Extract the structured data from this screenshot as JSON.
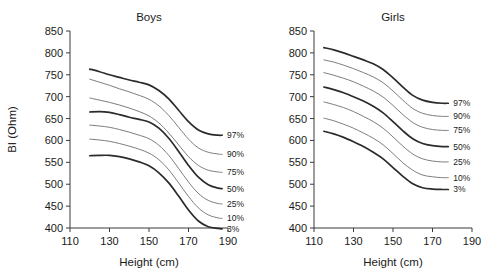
{
  "figure": {
    "width": 498,
    "height": 275,
    "background": "#ffffff",
    "ink_color": "#1a1a1a",
    "axis_color": "#3a3a3a"
  },
  "chart_data": [
    {
      "type": "line",
      "title": "Boys",
      "xlabel": "Height (cm)",
      "ylabel": "BI (Ohm)",
      "xlim": [
        110,
        190
      ],
      "ylim": [
        400,
        850
      ],
      "xticks": [
        110,
        130,
        150,
        170,
        190
      ],
      "yticks": [
        400,
        450,
        500,
        550,
        600,
        650,
        700,
        750,
        800,
        850
      ],
      "grid": false,
      "legend_position": "right-of-curve-ends",
      "x": [
        120,
        125,
        130,
        135,
        140,
        145,
        150,
        155,
        160,
        165,
        170,
        175,
        180,
        185,
        187
      ],
      "series": [
        {
          "name": "97%",
          "label": "97%",
          "emphasis": true,
          "color": "#2b2b2b",
          "width": 1.7,
          "values": [
            763,
            757,
            750,
            744,
            738,
            733,
            727,
            714,
            695,
            669,
            643,
            624,
            615,
            612,
            612
          ]
        },
        {
          "name": "90%",
          "label": "90%",
          "emphasis": false,
          "color": "#6e6e6e",
          "width": 0.9,
          "values": [
            740,
            733,
            726,
            718,
            711,
            703,
            694,
            679,
            657,
            630,
            603,
            583,
            573,
            569,
            568
          ]
        },
        {
          "name": "75%",
          "label": "75%",
          "emphasis": false,
          "color": "#6e6e6e",
          "width": 0.9,
          "values": [
            697,
            692,
            687,
            681,
            674,
            666,
            656,
            640,
            617,
            590,
            563,
            543,
            532,
            528,
            527
          ]
        },
        {
          "name": "50%",
          "label": "50%",
          "emphasis": true,
          "color": "#2b2b2b",
          "width": 1.7,
          "values": [
            665,
            666,
            664,
            659,
            653,
            648,
            642,
            628,
            605,
            575,
            543,
            516,
            499,
            491,
            490
          ]
        },
        {
          "name": "25%",
          "label": "25%",
          "emphasis": false,
          "color": "#6e6e6e",
          "width": 0.9,
          "values": [
            635,
            633,
            630,
            625,
            619,
            612,
            604,
            589,
            566,
            536,
            505,
            479,
            463,
            456,
            455
          ]
        },
        {
          "name": "10%",
          "label": "10%",
          "emphasis": false,
          "color": "#6e6e6e",
          "width": 0.9,
          "values": [
            603,
            601,
            598,
            593,
            587,
            580,
            571,
            556,
            533,
            503,
            472,
            446,
            430,
            423,
            422
          ]
        },
        {
          "name": "3%",
          "label": "3%",
          "emphasis": true,
          "color": "#2b2b2b",
          "width": 1.7,
          "values": [
            565,
            566,
            566,
            563,
            558,
            551,
            542,
            526,
            503,
            473,
            441,
            416,
            403,
            399,
            398
          ]
        }
      ]
    },
    {
      "type": "line",
      "title": "Girls",
      "xlabel": "Height (cm)",
      "ylabel": "BI (Ohm)",
      "xlim": [
        110,
        190
      ],
      "ylim": [
        400,
        850
      ],
      "xticks": [
        110,
        130,
        150,
        170,
        190
      ],
      "yticks": [
        400,
        450,
        500,
        550,
        600,
        650,
        700,
        750,
        800,
        850
      ],
      "grid": false,
      "legend_position": "right-of-curve-ends",
      "x": [
        115,
        120,
        125,
        130,
        135,
        140,
        145,
        150,
        155,
        160,
        165,
        170,
        175,
        178
      ],
      "series": [
        {
          "name": "97%",
          "label": "97%",
          "emphasis": true,
          "color": "#2b2b2b",
          "width": 1.7,
          "values": [
            812,
            807,
            800,
            792,
            784,
            775,
            762,
            743,
            722,
            703,
            692,
            687,
            685,
            685
          ]
        },
        {
          "name": "90%",
          "label": "90%",
          "emphasis": false,
          "color": "#6e6e6e",
          "width": 0.9,
          "values": [
            784,
            779,
            772,
            764,
            755,
            745,
            732,
            713,
            692,
            673,
            662,
            657,
            655,
            655
          ]
        },
        {
          "name": "75%",
          "label": "75%",
          "emphasis": false,
          "color": "#6e6e6e",
          "width": 0.9,
          "values": [
            755,
            749,
            742,
            734,
            724,
            713,
            699,
            680,
            659,
            641,
            630,
            625,
            623,
            623
          ]
        },
        {
          "name": "50%",
          "label": "50%",
          "emphasis": true,
          "color": "#2b2b2b",
          "width": 1.7,
          "values": [
            722,
            716,
            709,
            700,
            690,
            678,
            663,
            643,
            622,
            604,
            593,
            588,
            586,
            586
          ]
        },
        {
          "name": "25%",
          "label": "25%",
          "emphasis": false,
          "color": "#6e6e6e",
          "width": 0.9,
          "values": [
            688,
            682,
            675,
            666,
            655,
            643,
            628,
            608,
            587,
            569,
            558,
            553,
            551,
            551
          ]
        },
        {
          "name": "10%",
          "label": "10%",
          "emphasis": false,
          "color": "#6e6e6e",
          "width": 0.9,
          "values": [
            651,
            645,
            637,
            628,
            617,
            605,
            590,
            570,
            549,
            532,
            521,
            517,
            515,
            515
          ]
        },
        {
          "name": "3%",
          "label": "3%",
          "emphasis": true,
          "color": "#2b2b2b",
          "width": 1.7,
          "values": [
            621,
            615,
            607,
            597,
            586,
            573,
            558,
            538,
            518,
            501,
            492,
            489,
            488,
            488
          ]
        }
      ]
    }
  ]
}
